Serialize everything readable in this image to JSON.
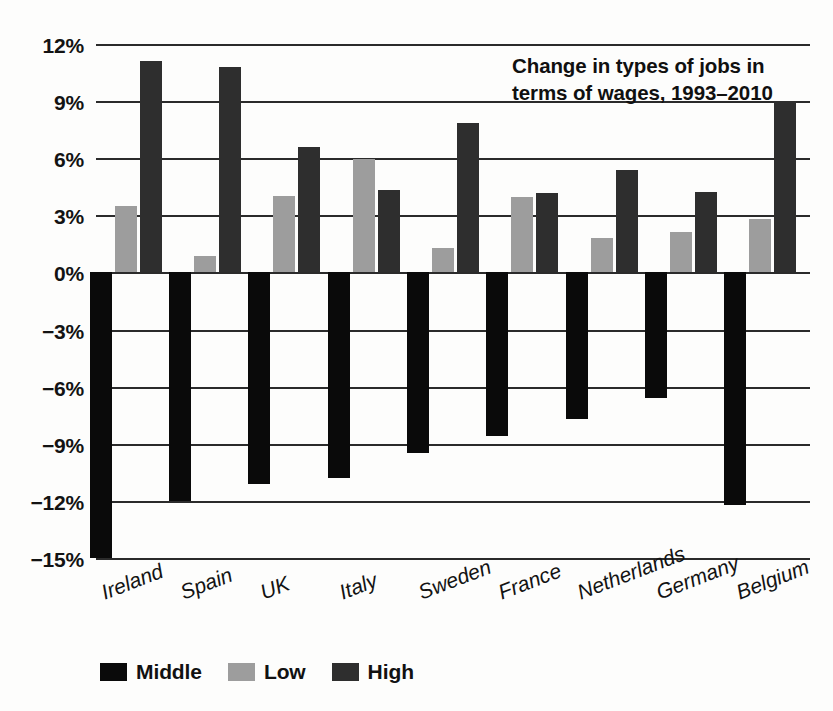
{
  "chart_data": {
    "type": "bar",
    "title": "Change in types of jobs in terms of wages, 1993–2010",
    "title_line1": "Change in types of jobs in",
    "title_line2": "terms of wages, 1993–2010",
    "xlabel": "",
    "ylabel": "",
    "ylim": [
      -15,
      12
    ],
    "ytick_step": 3,
    "grid": true,
    "legend_position": "bottom-left",
    "orientation": "vertical",
    "categories": [
      "Ireland",
      "Spain",
      "UK",
      "Italy",
      "Sweden",
      "France",
      "Netherlands",
      "Germany",
      "Belgium"
    ],
    "ytick_labels": [
      "12%",
      "9%",
      "6%",
      "3%",
      "0%",
      "−3%",
      "−6%",
      "−9%",
      "−12%",
      "−15%"
    ],
    "ytick_values": [
      12,
      9,
      6,
      3,
      0,
      -3,
      -6,
      -9,
      -12,
      -15
    ],
    "series": [
      {
        "name": "Middle",
        "color": "#0a0a0a",
        "values": [
          -15.0,
          -12.0,
          -11.1,
          -10.8,
          -9.5,
          -8.6,
          -7.7,
          -6.6,
          -12.2
        ]
      },
      {
        "name": "Low",
        "color": "#9d9d9d",
        "values": [
          3.5,
          0.85,
          4.0,
          5.95,
          1.3,
          3.95,
          1.8,
          2.1,
          2.8
        ]
      },
      {
        "name": "High",
        "color": "#2e2e2e",
        "values": [
          11.1,
          10.8,
          6.6,
          4.35,
          7.85,
          4.15,
          5.4,
          4.2,
          9.0
        ]
      }
    ]
  },
  "legend": {
    "items": [
      {
        "label": "Middle",
        "color": "#0a0a0a"
      },
      {
        "label": "Low",
        "color": "#9d9d9d"
      },
      {
        "label": "High",
        "color": "#2e2e2e"
      }
    ]
  }
}
